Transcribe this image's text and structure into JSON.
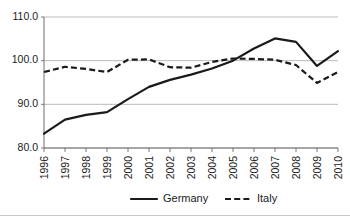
{
  "chart_data": {
    "type": "line",
    "title": "",
    "subtitle": "",
    "xlabel": "",
    "ylabel": "",
    "categories": [
      "1996",
      "1997",
      "1998",
      "1999",
      "2000",
      "2001",
      "2002",
      "2003",
      "2004",
      "2005",
      "2006",
      "2007",
      "2008",
      "2009",
      "2010"
    ],
    "ylim": [
      80.0,
      110.0
    ],
    "ytick_labels": [
      "110.0",
      "100.0",
      "90.0",
      "80.0"
    ],
    "ytick_values": [
      110.0,
      100.0,
      90.0,
      80.0
    ],
    "grid": true,
    "grid_axis": "y",
    "legend_position": "bottom",
    "series": [
      {
        "name": "Germany",
        "style": "solid",
        "color": "#1a1a1a",
        "values": [
          83.3,
          86.5,
          87.6,
          88.2,
          91.2,
          94.0,
          95.6,
          96.8,
          98.2,
          100.0,
          102.8,
          105.1,
          104.3,
          98.8,
          102.2
        ]
      },
      {
        "name": "Italy",
        "style": "dashed",
        "color": "#1a1a1a",
        "values": [
          97.4,
          98.6,
          98.1,
          97.4,
          100.2,
          100.3,
          98.5,
          98.4,
          99.7,
          100.5,
          100.4,
          100.2,
          99.0,
          94.9,
          97.4
        ]
      }
    ]
  },
  "legend": {
    "items": [
      {
        "label": "Germany",
        "style": "solid"
      },
      {
        "label": "Italy",
        "style": "dashed"
      }
    ]
  },
  "axes": {
    "y": {
      "labels": [
        "110.0",
        "100.0",
        "90.0",
        "80.0"
      ]
    },
    "x": {
      "labels": [
        "1996",
        "1997",
        "1998",
        "1999",
        "2000",
        "2001",
        "2002",
        "2003",
        "2004",
        "2005",
        "2006",
        "2007",
        "2008",
        "2009",
        "2010"
      ]
    }
  }
}
